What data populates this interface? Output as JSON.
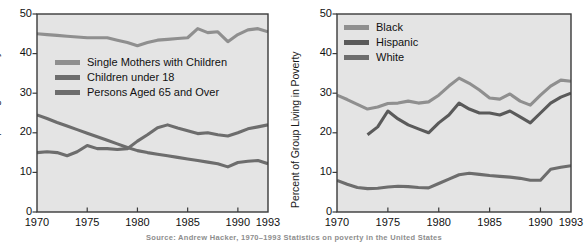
{
  "figure": {
    "background": "#ffffff",
    "plot_background": "#e4e4e4",
    "axis_color": "#3a3a3a",
    "caption": "Source: Andrew Hacker, 1970–1993 Statistics on poverty in the United States"
  },
  "chart_data": [
    {
      "type": "line",
      "id": "left",
      "title": "",
      "xlabel": "",
      "ylabel": "Percent of Group Living in Poverty",
      "xlim": [
        1970,
        1993
      ],
      "ylim": [
        0,
        50
      ],
      "yticks": [
        0,
        10,
        20,
        30,
        40,
        50
      ],
      "xticks": [
        1970,
        1975,
        1980,
        1985,
        1990,
        1993
      ],
      "grid": false,
      "legend_position": "upper-left-inside",
      "series": [
        {
          "name": "Single Mothers with Children",
          "color": "#8f8f8f",
          "x": [
            1970,
            1971,
            1972,
            1973,
            1974,
            1975,
            1976,
            1977,
            1978,
            1979,
            1980,
            1981,
            1982,
            1983,
            1984,
            1985,
            1986,
            1987,
            1988,
            1989,
            1990,
            1991,
            1992,
            1993
          ],
          "values": [
            45.0,
            44.8,
            44.6,
            44.4,
            44.2,
            44.0,
            44.0,
            44.0,
            43.4,
            42.8,
            42.0,
            42.8,
            43.4,
            43.6,
            43.8,
            44.0,
            46.3,
            45.3,
            45.5,
            43.0,
            44.8,
            46.0,
            46.3,
            45.5
          ]
        },
        {
          "name": "Children under 18",
          "color": "#6d6d6d",
          "x": [
            1970,
            1971,
            1972,
            1973,
            1974,
            1975,
            1976,
            1977,
            1978,
            1979,
            1980,
            1981,
            1982,
            1983,
            1984,
            1985,
            1986,
            1987,
            1988,
            1989,
            1990,
            1991,
            1992,
            1993
          ],
          "values": [
            15.0,
            15.2,
            15.0,
            14.2,
            15.2,
            16.8,
            16.0,
            16.0,
            15.8,
            16.0,
            17.9,
            19.5,
            21.3,
            22.0,
            21.2,
            20.5,
            19.8,
            20.0,
            19.5,
            19.2,
            20.0,
            21.0,
            21.5,
            22.0
          ]
        },
        {
          "name": "Persons Aged 65 and Over",
          "color": "#6d6d6d",
          "x": [
            1970,
            1971,
            1972,
            1973,
            1974,
            1975,
            1976,
            1977,
            1978,
            1979,
            1980,
            1981,
            1982,
            1983,
            1984,
            1985,
            1986,
            1987,
            1988,
            1989,
            1990,
            1991,
            1992,
            1993
          ],
          "values": [
            24.5,
            23.6,
            22.6,
            21.7,
            20.8,
            19.9,
            19.0,
            18.1,
            17.2,
            16.3,
            15.5,
            15.0,
            14.6,
            14.2,
            13.8,
            13.4,
            13.0,
            12.6,
            12.2,
            11.4,
            12.5,
            12.8,
            13.0,
            12.2
          ]
        }
      ]
    },
    {
      "type": "line",
      "id": "right",
      "title": "",
      "xlabel": "",
      "ylabel": "Percent of Group Living in Poverty",
      "xlim": [
        1970,
        1993
      ],
      "ylim": [
        0,
        50
      ],
      "yticks": [
        0,
        10,
        20,
        30,
        40,
        50
      ],
      "xticks": [
        1970,
        1975,
        1980,
        1985,
        1990,
        1993
      ],
      "grid": false,
      "legend_position": "upper-left-inside",
      "series": [
        {
          "name": "Black",
          "color": "#8f8f8f",
          "x": [
            1970,
            1971,
            1972,
            1973,
            1974,
            1975,
            1976,
            1977,
            1978,
            1979,
            1980,
            1981,
            1982,
            1983,
            1984,
            1985,
            1986,
            1987,
            1988,
            1989,
            1990,
            1991,
            1992,
            1993
          ],
          "values": [
            29.5,
            28.4,
            27.2,
            26.0,
            26.5,
            27.4,
            27.5,
            28.0,
            27.5,
            27.8,
            29.5,
            31.8,
            33.8,
            32.5,
            30.8,
            28.8,
            28.5,
            29.8,
            28.0,
            27.0,
            29.5,
            31.8,
            33.3,
            33.0
          ]
        },
        {
          "name": "Hispanic",
          "color": "#5a5a5a",
          "x": [
            1973,
            1974,
            1975,
            1976,
            1977,
            1978,
            1979,
            1980,
            1981,
            1982,
            1983,
            1984,
            1985,
            1986,
            1987,
            1988,
            1989,
            1990,
            1991,
            1992,
            1993
          ],
          "values": [
            19.5,
            21.5,
            25.5,
            23.5,
            22.0,
            21.0,
            20.0,
            22.5,
            24.5,
            27.5,
            26.0,
            25.0,
            25.0,
            24.5,
            25.5,
            24.0,
            22.5,
            25.0,
            27.5,
            29.0,
            30.0
          ]
        },
        {
          "name": "White",
          "color": "#6d6d6d",
          "x": [
            1970,
            1971,
            1972,
            1973,
            1974,
            1975,
            1976,
            1977,
            1978,
            1979,
            1980,
            1981,
            1982,
            1983,
            1984,
            1985,
            1986,
            1987,
            1988,
            1989,
            1990,
            1991,
            1992,
            1993
          ],
          "values": [
            8.0,
            7.0,
            6.2,
            5.9,
            6.0,
            6.3,
            6.5,
            6.4,
            6.2,
            6.1,
            7.2,
            8.3,
            9.4,
            9.8,
            9.5,
            9.2,
            9.0,
            8.8,
            8.5,
            8.0,
            8.0,
            10.8,
            11.3,
            11.7
          ]
        }
      ]
    }
  ]
}
